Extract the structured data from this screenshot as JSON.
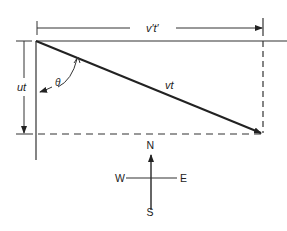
{
  "diagram": {
    "labels": {
      "v_prime_t_prime": "v′t′",
      "vt": "vt",
      "ut": "ut",
      "theta": "θ"
    },
    "compass": {
      "north": "N",
      "south": "S",
      "east": "E",
      "west": "W"
    },
    "colors": {
      "stroke": "#222222",
      "background": "#ffffff"
    }
  }
}
